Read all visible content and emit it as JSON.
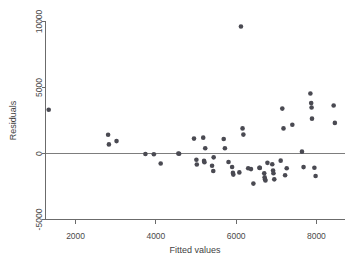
{
  "chart_data": {
    "type": "scatter",
    "title": "",
    "xlabel": "Fitted values",
    "ylabel": "Residuals",
    "xlim": [
      1250,
      8700
    ],
    "ylim": [
      -5000,
      10000
    ],
    "xticks": [
      2000,
      4000,
      6000,
      8000
    ],
    "yticks": [
      -5000,
      0,
      5000,
      10000
    ],
    "xtick_labels": [
      "2000",
      "4000",
      "6000",
      "8000"
    ],
    "ytick_labels": [
      "-5000",
      "0",
      "5000",
      "10000"
    ],
    "grid": false,
    "legend": null,
    "reference_line": {
      "type": "horizontal",
      "y": 0
    },
    "marker": {
      "shape": "circle",
      "size": 2.3,
      "color": "#4a4a52"
    },
    "series": [
      {
        "name": "residuals",
        "points": [
          [
            1330,
            3320
          ],
          [
            2810,
            1420
          ],
          [
            2830,
            690
          ],
          [
            3020,
            940
          ],
          [
            3740,
            -40
          ],
          [
            3950,
            -60
          ],
          [
            4120,
            -760
          ],
          [
            4560,
            0
          ],
          [
            4580,
            -20
          ],
          [
            4950,
            1130
          ],
          [
            5010,
            -470
          ],
          [
            5020,
            -830
          ],
          [
            5180,
            1200
          ],
          [
            5200,
            -560
          ],
          [
            5210,
            -660
          ],
          [
            5230,
            400
          ],
          [
            5400,
            -930
          ],
          [
            5430,
            -1330
          ],
          [
            5440,
            -290
          ],
          [
            5690,
            1100
          ],
          [
            5720,
            400
          ],
          [
            5810,
            -640
          ],
          [
            5900,
            -1020
          ],
          [
            5920,
            -1470
          ],
          [
            5930,
            -1600
          ],
          [
            6080,
            -1430
          ],
          [
            6120,
            9620
          ],
          [
            6160,
            1900
          ],
          [
            6180,
            1430
          ],
          [
            6300,
            -1120
          ],
          [
            6370,
            -1180
          ],
          [
            6430,
            -2280
          ],
          [
            6580,
            -1080
          ],
          [
            6590,
            -1090
          ],
          [
            6700,
            -1500
          ],
          [
            6710,
            -1800
          ],
          [
            6720,
            -1960
          ],
          [
            6730,
            -2040
          ],
          [
            6780,
            -710
          ],
          [
            6900,
            -820
          ],
          [
            6920,
            -1290
          ],
          [
            6930,
            -1500
          ],
          [
            6950,
            -1960
          ],
          [
            7110,
            -540
          ],
          [
            7150,
            3400
          ],
          [
            7180,
            1900
          ],
          [
            7220,
            -1650
          ],
          [
            7260,
            -1120
          ],
          [
            7400,
            2180
          ],
          [
            7640,
            140
          ],
          [
            7680,
            -1030
          ],
          [
            7850,
            4540
          ],
          [
            7870,
            3820
          ],
          [
            7880,
            3490
          ],
          [
            7890,
            2640
          ],
          [
            7950,
            -1080
          ],
          [
            7980,
            -1700
          ],
          [
            8430,
            3640
          ],
          [
            8460,
            2320
          ]
        ]
      }
    ]
  },
  "axes": {
    "x_title": "Fitted values",
    "y_title": "Residuals"
  }
}
